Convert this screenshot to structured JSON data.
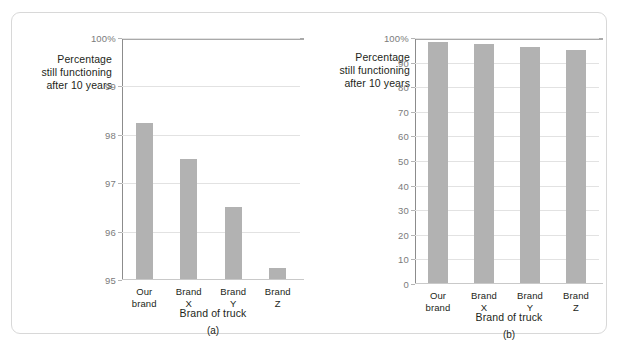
{
  "figure": {
    "bar_color": "#b2b2b2",
    "gridline_color": "#e2e2e2",
    "axis_color": "#8c8c8c",
    "frame_color": "#d8d8d8",
    "background": "#ffffff"
  },
  "panels": [
    {
      "caption": "(a)",
      "y_axis_label_lines": [
        "Percentage",
        "still functioning",
        "after 10 years"
      ],
      "x_axis_title": "Brand of truck",
      "chart_data": {
        "type": "bar",
        "title": "",
        "xlabel": "Brand of truck",
        "ylabel": "Percentage still functioning after 10 years",
        "categories": [
          "Our brand",
          "Brand X",
          "Brand Y",
          "Brand Z"
        ],
        "category_lines": [
          [
            "Our",
            "brand"
          ],
          [
            "Brand",
            "X"
          ],
          [
            "Brand",
            "Y"
          ],
          [
            "Brand",
            "Z"
          ]
        ],
        "values": [
          98.25,
          97.5,
          96.5,
          95.25
        ],
        "ylim": [
          95,
          100
        ],
        "yticks": [
          95,
          96,
          97,
          98,
          99,
          100
        ],
        "ytick_labels": [
          "95",
          "96",
          "97",
          "98",
          "99",
          "100%"
        ],
        "grid": true,
        "legend": "none"
      }
    },
    {
      "caption": "(b)",
      "y_axis_label_lines": [
        "Percentage",
        "still functioning",
        "after 10 years"
      ],
      "x_axis_title": "Brand of truck",
      "chart_data": {
        "type": "bar",
        "title": "",
        "xlabel": "Brand of truck",
        "ylabel": "Percentage still functioning after 10 years",
        "categories": [
          "Our brand",
          "Brand X",
          "Brand Y",
          "Brand Z"
        ],
        "category_lines": [
          [
            "Our",
            "brand"
          ],
          [
            "Brand",
            "X"
          ],
          [
            "Brand",
            "Y"
          ],
          [
            "Brand",
            "Z"
          ]
        ],
        "values": [
          98.25,
          97.5,
          96.5,
          95.25
        ],
        "ylim": [
          0,
          100
        ],
        "yticks": [
          0,
          10,
          20,
          30,
          40,
          50,
          60,
          70,
          80,
          90,
          100
        ],
        "ytick_labels": [
          "0",
          "10",
          "20",
          "30",
          "40",
          "50",
          "60",
          "70",
          "80",
          "90",
          "100%"
        ],
        "grid": true,
        "legend": "none"
      }
    }
  ]
}
